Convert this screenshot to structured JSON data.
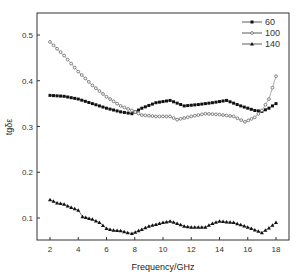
{
  "chart_data": {
    "type": "scatter",
    "title": "",
    "xlabel": "Frequency/GHz",
    "ylabel": "tgδε",
    "xlim": [
      1,
      19
    ],
    "ylim": [
      0.05,
      0.55
    ],
    "xticks": [
      2,
      4,
      6,
      8,
      10,
      12,
      14,
      16,
      18
    ],
    "yticks": [
      0.1,
      0.2,
      0.3,
      0.4,
      0.5
    ],
    "grid": false,
    "legend_position": "upper right",
    "series": [
      {
        "name": "60",
        "marker": "square",
        "x": [
          2,
          3,
          4,
          5,
          6,
          7,
          7.8,
          8.5,
          9.5,
          10.5,
          11.5,
          12.5,
          13.5,
          14.5,
          15.5,
          16.5,
          17,
          17.5,
          18
        ],
        "values": [
          0.368,
          0.366,
          0.36,
          0.35,
          0.34,
          0.332,
          0.328,
          0.34,
          0.352,
          0.357,
          0.345,
          0.348,
          0.352,
          0.357,
          0.345,
          0.335,
          0.333,
          0.34,
          0.35
        ]
      },
      {
        "name": "100",
        "marker": "circle-open",
        "x": [
          2,
          3,
          4,
          5,
          6,
          7,
          7.8,
          8.5,
          9.5,
          10.5,
          11,
          12,
          13,
          14,
          15,
          15.8,
          16.5,
          17,
          17.5,
          18
        ],
        "values": [
          0.485,
          0.455,
          0.42,
          0.39,
          0.365,
          0.345,
          0.335,
          0.325,
          0.322,
          0.322,
          0.315,
          0.322,
          0.328,
          0.326,
          0.322,
          0.31,
          0.32,
          0.335,
          0.36,
          0.41
        ]
      },
      {
        "name": "140",
        "marker": "triangle",
        "x": [
          2,
          2.5,
          3,
          3.5,
          4,
          4.3,
          5,
          5.5,
          6,
          6.5,
          7,
          7.5,
          7.8,
          8.5,
          9,
          10,
          10.5,
          11,
          11.5,
          12,
          13,
          13.5,
          14,
          15,
          16,
          17,
          17.5,
          18
        ],
        "values": [
          0.14,
          0.133,
          0.13,
          0.123,
          0.117,
          0.103,
          0.097,
          0.09,
          0.077,
          0.073,
          0.072,
          0.068,
          0.066,
          0.075,
          0.082,
          0.09,
          0.093,
          0.088,
          0.082,
          0.08,
          0.08,
          0.088,
          0.093,
          0.09,
          0.08,
          0.068,
          0.078,
          0.09
        ]
      }
    ]
  },
  "legend": {
    "items": [
      {
        "label": "60"
      },
      {
        "label": "100"
      },
      {
        "label": "140"
      }
    ]
  }
}
